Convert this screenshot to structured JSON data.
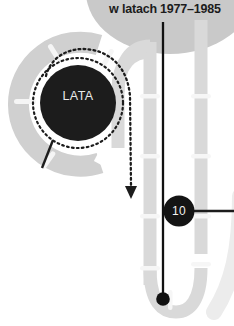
{
  "canvas": {
    "width": 234,
    "height": 326,
    "background": "#ffffff"
  },
  "header": {
    "title": "w latach 1977–1985",
    "text_color": "#1c1c1c",
    "backdrop_shape": "ellipse-gray",
    "backdrop_color": "#c9c9c9"
  },
  "hub": {
    "label": "LATA",
    "label_color": "#e9e9e9",
    "fill": "#1c1c1c",
    "cx": 78,
    "cy": 103,
    "r": 38,
    "dotted_ring": {
      "r": 45,
      "color": "#1c1c1c",
      "dash": "1.6 3.2"
    }
  },
  "marker_badge": {
    "label": "10",
    "label_color": "#f2f2f2",
    "fill": "#141414",
    "cx": 179,
    "cy": 211,
    "r": 15,
    "leader_line_color": "#1c1c1c"
  },
  "tracks": {
    "color_outer": "#d2d2d2",
    "color_inner": "#dedede",
    "tick_color": "#f4f4f4",
    "arc_left": {
      "name": "left-c-arc",
      "color": "#d0d0d0",
      "stroke_width": 20
    },
    "rail_inner": {
      "name": "inner-vertical-rail",
      "color": "#d9d9d9",
      "stroke_width": 13
    },
    "rail_outer": {
      "name": "outer-vertical-rail",
      "color": "#d9d9d9",
      "stroke_width": 13
    },
    "u_curve": {
      "name": "bottom-u-curve",
      "color": "#d9d9d9"
    },
    "right_edge_arc": {
      "name": "right-edge-arc",
      "color": "#ececec"
    }
  },
  "pointer": {
    "name": "black-pointer-line",
    "color": "#111111",
    "stroke_width": 2.2,
    "x": 163,
    "y_top": 22,
    "y_end": 300,
    "end_dot_r": 6.5
  },
  "dotted_arrow": {
    "name": "dotted-flow-arrow",
    "color": "#1c1c1c",
    "arrow_tip_x": 132,
    "arrow_tip_y": 196
  },
  "hub_ticks": {
    "color": "#1c1c1c",
    "count": 3
  },
  "palette": {
    "black": "#1c1c1c",
    "gray_light": "#d9d9d9",
    "gray_mid": "#c9c9c9",
    "gray_pale": "#ececec",
    "white": "#ffffff"
  }
}
